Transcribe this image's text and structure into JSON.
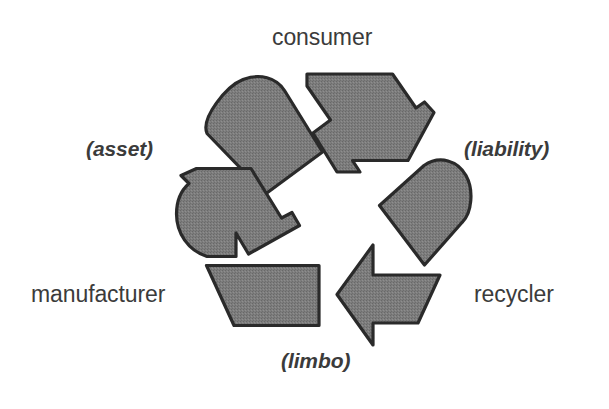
{
  "diagram": {
    "symbol": "recycling-mobius-loop",
    "arrow_count": 3,
    "rotation_direction": "counterclockwise",
    "colors": {
      "background": "#ffffff",
      "arrow_fill": "#7a7a7a",
      "arrow_outline": "#2a2a2a",
      "label_text": "#3b3b3b"
    },
    "nodes": [
      {
        "id": "consumer",
        "label": "consumer",
        "style": "plain",
        "position": "top"
      },
      {
        "id": "manufacturer",
        "label": "manufacturer",
        "style": "plain",
        "position": "bottom-left"
      },
      {
        "id": "recycler",
        "label": "recycler",
        "style": "plain",
        "position": "bottom-right"
      }
    ],
    "states": [
      {
        "id": "asset",
        "label": "(asset)",
        "style": "italic",
        "position": "upper-left",
        "between": [
          "manufacturer",
          "consumer"
        ]
      },
      {
        "id": "liability",
        "label": "(liability)",
        "style": "italic",
        "position": "upper-right",
        "between": [
          "consumer",
          "recycler"
        ]
      },
      {
        "id": "limbo",
        "label": "(limbo)",
        "style": "italic",
        "position": "bottom",
        "between": [
          "recycler",
          "manufacturer"
        ]
      }
    ]
  }
}
